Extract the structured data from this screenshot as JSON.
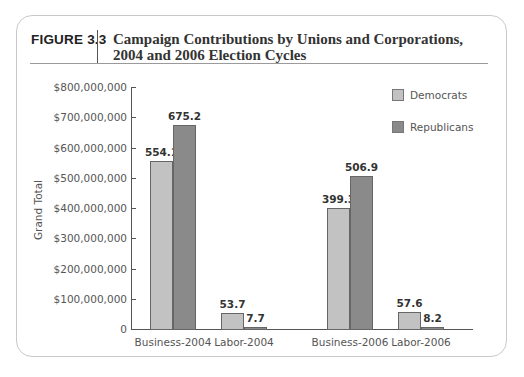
{
  "figure": {
    "label": "FIGURE 3.3",
    "title": "Campaign Contributions by Unions and Corporations, 2004 and 2006 Election Cycles"
  },
  "colors": {
    "democrats": "#c2c2c2",
    "republicans": "#8a8a8a"
  },
  "chart_data": {
    "type": "bar",
    "title": "Campaign Contributions by Unions and Corporations, 2004 and 2006 Election Cycles",
    "xlabel": "",
    "ylabel": "Grand Total",
    "ylim": [
      0,
      800000000
    ],
    "yticks": [
      "0",
      "$100,000,000",
      "$200,000,000",
      "$300,000,000",
      "$400,000,000",
      "$500,000,000",
      "$600,000,000",
      "$700,000,000",
      "$800,000,000"
    ],
    "categories": [
      "Business-2004",
      "Labor-2004",
      "Business-2006",
      "Labor-2006"
    ],
    "series": [
      {
        "name": "Democrats",
        "values": [
          554.1,
          53.7,
          399.3,
          57.6
        ],
        "labels": [
          "554.1",
          "53.7",
          "399.3",
          "57.6"
        ]
      },
      {
        "name": "Republicans",
        "values": [
          675.2,
          7.7,
          506.9,
          8.2
        ],
        "labels": [
          "675.2",
          "7.7",
          "506.9",
          "8.2"
        ]
      }
    ],
    "value_units": "millions of dollars",
    "legend_position": "upper right",
    "grid": false
  }
}
